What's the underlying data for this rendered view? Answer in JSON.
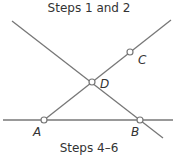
{
  "captions": {
    "top": "Steps 1 and 2",
    "bottom": "Steps 4–6"
  },
  "colors": {
    "line": "#777777",
    "text": "#333333",
    "point_fill": "#ffffff"
  },
  "diagram": {
    "lines": [
      {
        "name": "line-through-D-and-B",
        "x1": 12,
        "y1": 21,
        "x2": 163,
        "y2": 138
      },
      {
        "name": "line-through-A-D-C",
        "x1": 44,
        "y1": 120,
        "x2": 171,
        "y2": 20
      },
      {
        "name": "horizontal-line-AB",
        "x1": 3,
        "y1": 120,
        "x2": 173,
        "y2": 120
      }
    ],
    "points": [
      {
        "label": "A",
        "x": 44,
        "y": 120,
        "lx": 33,
        "ly": 136
      },
      {
        "label": "B",
        "x": 140,
        "y": 120,
        "lx": 131,
        "ly": 136
      },
      {
        "label": "C",
        "x": 130,
        "y": 52,
        "lx": 138,
        "ly": 64
      },
      {
        "label": "D",
        "x": 92,
        "y": 82,
        "lx": 100,
        "ly": 88
      }
    ]
  }
}
